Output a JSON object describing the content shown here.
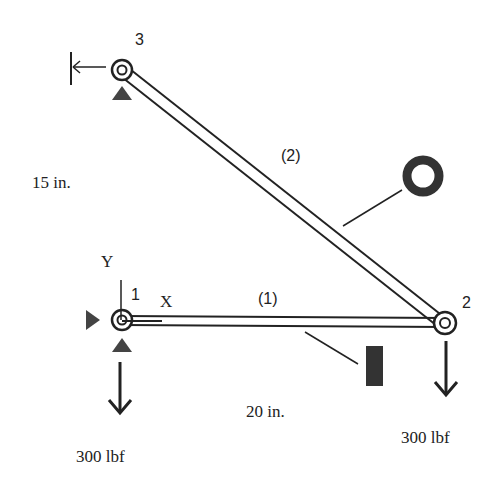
{
  "diagram": {
    "type": "truss",
    "nodes": [
      {
        "id": "1",
        "label": "1",
        "x": 0,
        "y": 0,
        "support": "pin (x and y restrained)"
      },
      {
        "id": "2",
        "label": "2",
        "x": 20,
        "y": 0,
        "support": "free"
      },
      {
        "id": "3",
        "label": "3",
        "x": 0,
        "y": 15,
        "support": "pin (x and y restrained)"
      }
    ],
    "elements": [
      {
        "id": "1",
        "label": "(1)",
        "from": "1",
        "to": "2",
        "cross_section": "rectangular (solid bar)"
      },
      {
        "id": "2",
        "label": "(2)",
        "from": "3",
        "to": "2",
        "cross_section": "hollow circular (tube)"
      }
    ],
    "axes": {
      "x_label": "X",
      "y_label": "Y"
    },
    "dimensions": {
      "horizontal": "20 in.",
      "vertical": "15 in."
    },
    "loads": [
      {
        "node": "1",
        "label": "300 lbf",
        "direction": "down"
      },
      {
        "node": "2",
        "label": "300 lbf",
        "direction": "down"
      }
    ],
    "colors": {
      "line": "#222222",
      "fill": "#444444",
      "background": "#ffffff"
    }
  }
}
